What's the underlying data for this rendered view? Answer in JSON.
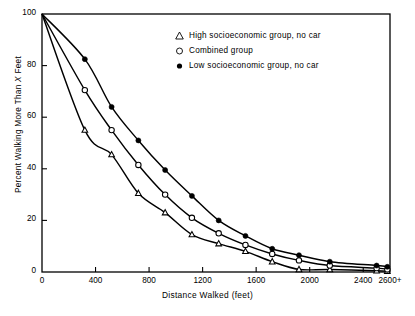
{
  "chart_data": {
    "type": "line",
    "title": "",
    "xlabel": "Distance Walked (feet)",
    "ylabel": "Percent Walking More Than X Feet",
    "xlim": [
      0,
      2600
    ],
    "ylim": [
      0,
      100
    ],
    "grid": false,
    "legend_position": "top-center",
    "xticks": [
      0,
      400,
      800,
      1200,
      1600,
      2000,
      2400,
      2600
    ],
    "xticklabels": [
      "0",
      "400",
      "800",
      "1200",
      "1600",
      "2000",
      "2400",
      "2600+"
    ],
    "yticks": [
      0,
      20,
      40,
      60,
      80,
      100
    ],
    "yticklabels": [
      "0",
      "20",
      "40",
      "60",
      "80",
      "100"
    ],
    "series": [
      {
        "name": "High socioeconomic group, no car",
        "marker": "open-triangle",
        "x": [
          0,
          320,
          520,
          720,
          920,
          1120,
          1320,
          1520,
          1720,
          1920,
          2150,
          2500,
          2580
        ],
        "values": [
          100,
          55,
          45.5,
          30.5,
          23,
          14.5,
          11,
          8,
          4,
          1,
          1,
          0.5,
          0.3
        ]
      },
      {
        "name": "Combined group",
        "marker": "open-circle",
        "x": [
          0,
          320,
          520,
          720,
          920,
          1120,
          1320,
          1520,
          1720,
          1920,
          2150,
          2500,
          2580
        ],
        "values": [
          100,
          70.5,
          55,
          41.5,
          30,
          21,
          15,
          10.5,
          7,
          4.5,
          2.5,
          1.5,
          1
        ]
      },
      {
        "name": "Low socioeconomic group, no car",
        "marker": "filled-circle",
        "x": [
          0,
          320,
          520,
          720,
          920,
          1120,
          1320,
          1520,
          1720,
          1920,
          2150,
          2500,
          2580
        ],
        "values": [
          100,
          82.5,
          64,
          51,
          39.5,
          29.5,
          20,
          14,
          9,
          6.5,
          4,
          2.5,
          2
        ]
      }
    ]
  },
  "legend": {
    "items": [
      {
        "marker": "open-triangle",
        "label": "High socioeconomic group, no car"
      },
      {
        "marker": "open-circle",
        "label": "Combined group"
      },
      {
        "marker": "filled-circle",
        "label": "Low socioeconomic group, no car"
      }
    ]
  },
  "axes": {
    "x_title": "Distance Walked (feet)",
    "y_title_pre": "Percent Walking More Than ",
    "y_title_var": "X",
    "y_title_post": " Feet"
  },
  "colors": {
    "line": "#000000",
    "axis": "#000000",
    "background": "#ffffff"
  }
}
